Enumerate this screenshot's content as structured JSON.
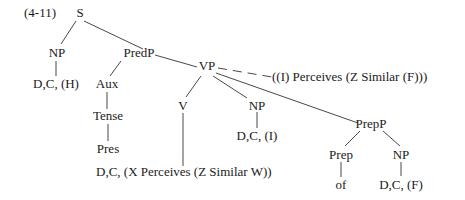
{
  "diagram": {
    "label": "(4-11)",
    "type": "syntax-tree",
    "nodes": {
      "S": "S",
      "NP_subj": "NP",
      "NP_subj_leaf": "D,C, (H)",
      "PredP": "PredP",
      "Aux": "Aux",
      "Tense": "Tense",
      "Pres": "Pres",
      "VP": "VP",
      "VP_annotation": "((I) Perceives (Z Similar (F)))",
      "V": "V",
      "V_leaf": "D,C, (X Perceives (Z Similar W))",
      "NP_obj": "NP",
      "NP_obj_leaf": "D,C, (I)",
      "PrepP": "PrepP",
      "Prep": "Prep",
      "Prep_leaf": "of",
      "NP_prep": "NP",
      "NP_prep_leaf": "D,C, (F)"
    },
    "edges": [
      [
        "S",
        "NP_subj"
      ],
      [
        "S",
        "PredP"
      ],
      [
        "NP_subj",
        "NP_subj_leaf"
      ],
      [
        "PredP",
        "Aux"
      ],
      [
        "PredP",
        "VP"
      ],
      [
        "Aux",
        "Tense"
      ],
      [
        "Tense",
        "Pres"
      ],
      [
        "VP",
        "V"
      ],
      [
        "VP",
        "NP_obj"
      ],
      [
        "VP",
        "PrepP"
      ],
      [
        "VP",
        "VP_annotation",
        "dashed"
      ],
      [
        "V",
        "V_leaf"
      ],
      [
        "NP_obj",
        "NP_obj_leaf"
      ],
      [
        "PrepP",
        "Prep"
      ],
      [
        "PrepP",
        "NP_prep"
      ],
      [
        "Prep",
        "Prep_leaf"
      ],
      [
        "NP_prep",
        "NP_prep_leaf"
      ]
    ]
  }
}
